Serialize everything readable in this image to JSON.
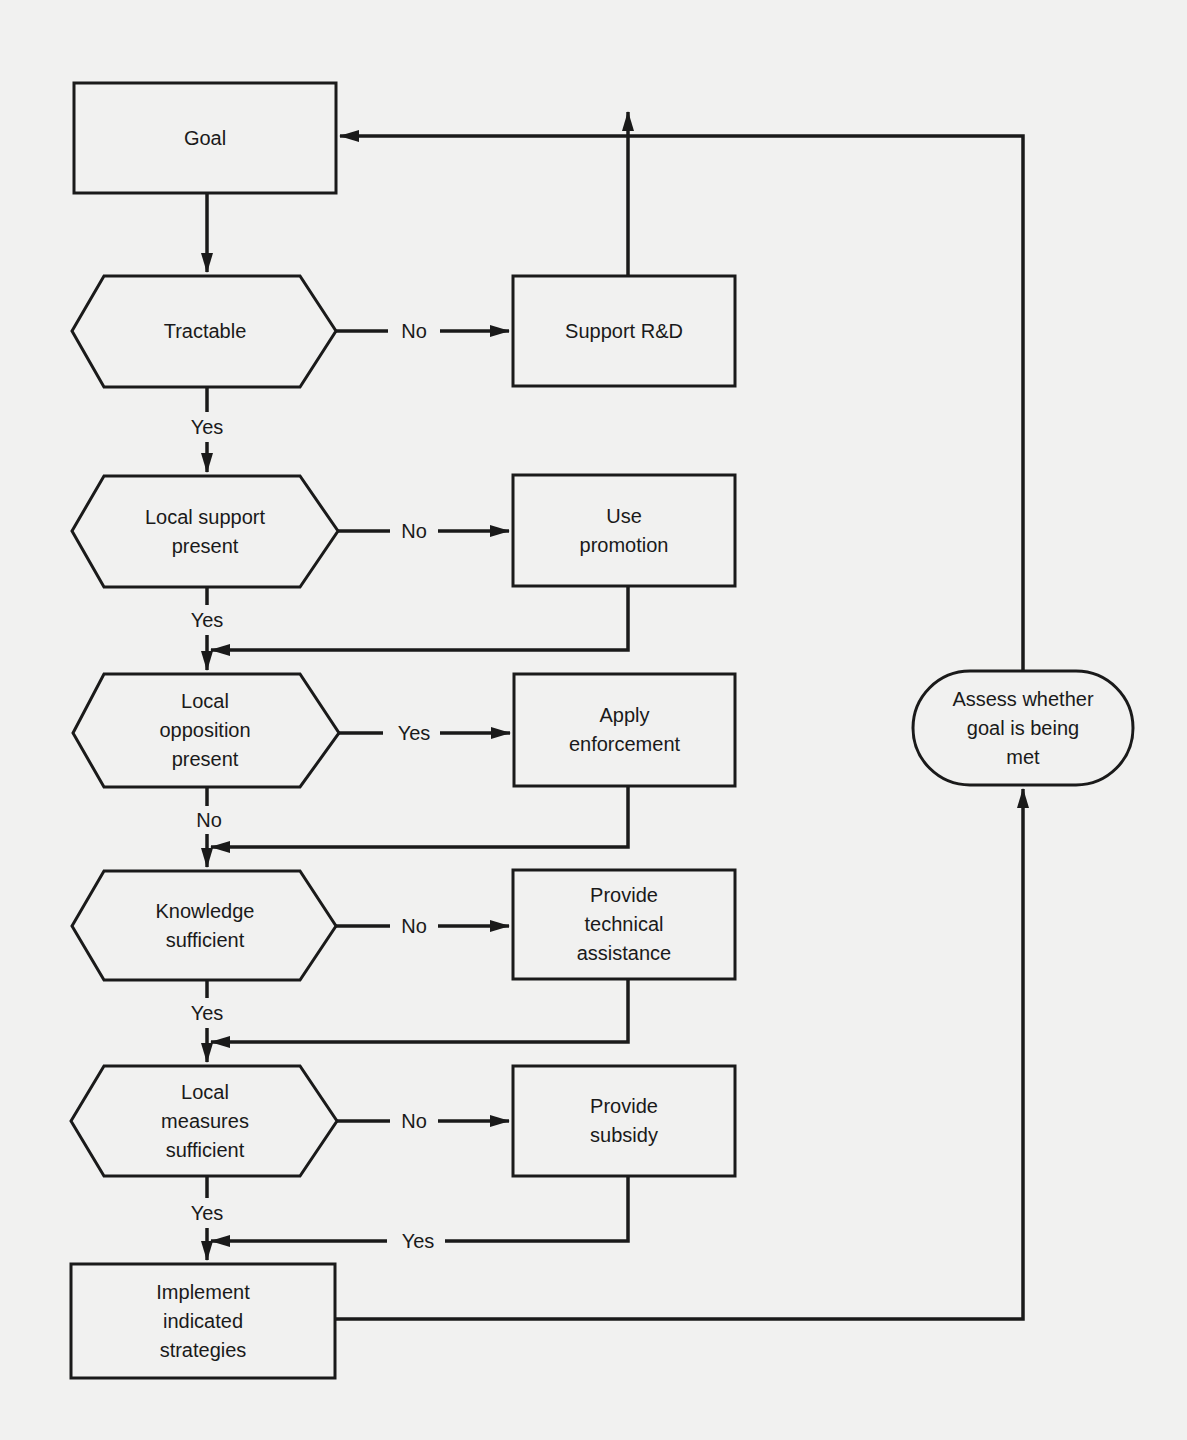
{
  "diagram": {
    "type": "flowchart",
    "nodes": {
      "goal": {
        "label": "Goal",
        "shape": "rectangle"
      },
      "tractable": {
        "label": "Tractable",
        "shape": "hexagon"
      },
      "support_rd": {
        "label": "Support R&D",
        "shape": "rectangle"
      },
      "local_support": {
        "label": "Local support\npresent",
        "shape": "hexagon"
      },
      "use_promotion": {
        "label": "Use\npromotion",
        "shape": "rectangle"
      },
      "local_opposition": {
        "label": "Local\nopposition\npresent",
        "shape": "hexagon"
      },
      "apply_enforcement": {
        "label": "Apply\nenforcement",
        "shape": "rectangle"
      },
      "knowledge": {
        "label": "Knowledge\nsufficient",
        "shape": "hexagon"
      },
      "technical_assistance": {
        "label": "Provide\ntechnical\nassistance",
        "shape": "rectangle"
      },
      "local_measures": {
        "label": "Local\nmeasures\nsufficient",
        "shape": "hexagon"
      },
      "provide_subsidy": {
        "label": "Provide\nsubsidy",
        "shape": "rectangle"
      },
      "implement": {
        "label": "Implement\nindicated\nstrategies",
        "shape": "rectangle"
      },
      "assess": {
        "label": "Assess whether\ngoal is being\nmet",
        "shape": "terminator"
      }
    },
    "edges": {
      "tractable_no": "No",
      "tractable_yes": "Yes",
      "local_support_no": "No",
      "local_support_yes": "Yes",
      "local_opposition_yes": "Yes",
      "local_opposition_no": "No",
      "knowledge_no": "No",
      "knowledge_yes": "Yes",
      "local_measures_no": "No",
      "local_measures_yes": "Yes",
      "subsidy_yes": "Yes"
    },
    "colors": {
      "background": "#f1f1f0",
      "stroke": "#1a1a1a"
    }
  }
}
